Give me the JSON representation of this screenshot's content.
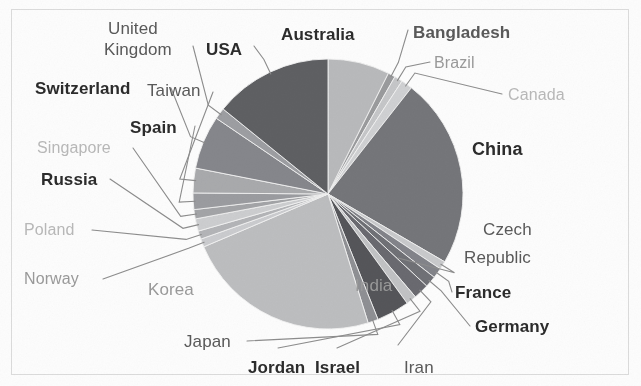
{
  "chart_data": {
    "type": "pie",
    "title": "",
    "subtitle": "",
    "xlabel": "",
    "ylabel": "",
    "legend_position": "callout-labels",
    "grid": false,
    "label_style": "leader-line callouts around pie",
    "categories": [
      "Australia",
      "Bangladesh",
      "Brazil",
      "Canada",
      "China",
      "Czech Republic",
      "France",
      "Germany",
      "Iran",
      "Israel",
      "Jordan",
      "Japan",
      "Korea",
      "Norway",
      "Poland",
      "Russia",
      "Singapore",
      "Spain",
      "Taiwan",
      "Switzerland",
      "USA",
      "United Kingdom",
      "India"
    ],
    "values": [
      6.0,
      0.7,
      0.8,
      1.1,
      18.5,
      0.8,
      1.0,
      1.1,
      1.5,
      1.0,
      3.2,
      1.0,
      19.0,
      0.8,
      0.8,
      1.2,
      0.9,
      1.6,
      2.4,
      5.2,
      11.5,
      1.1,
      16.8
    ],
    "units": "percent of total",
    "slice_order_clockwise_from_top": [
      "Australia",
      "Bangladesh",
      "Brazil",
      "Canada",
      "China",
      "Czech Republic",
      "France",
      "Germany",
      "Iran",
      "Israel",
      "Jordan",
      "Japan",
      "Korea",
      "Norway",
      "Poland",
      "Russia",
      "Singapore",
      "Spain",
      "Taiwan",
      "Switzerland",
      "United Kingdom",
      "USA"
    ]
  },
  "palette": {
    "background": "#fdfdfd",
    "border": "#dcdcdc",
    "label_dark": "#2c2c2c",
    "label_mid": "#5a5a5a",
    "label_light": "#9a9a9a",
    "label_faint": "#b9b9b9",
    "leader_line": "#8d8d8d",
    "slice_darkest": "#58595b",
    "slice_dark": "#6d6e70",
    "slice_mid": "#8a8b8d",
    "slice_light": "#a7a8aa",
    "slice_lighter": "#bcbdbf",
    "slice_lightest": "#d2d3d5"
  },
  "labels": [
    {
      "key": "united_kingdom",
      "text": "United",
      "weight": "500",
      "tone": "label_mid",
      "size": 17,
      "x": 108,
      "y": 20
    },
    {
      "key": "united_kingdom2",
      "text": "Kingdom",
      "weight": "500",
      "tone": "label_mid",
      "size": 17,
      "x": 104,
      "y": 41
    },
    {
      "key": "usa",
      "text": "USA",
      "weight": "700",
      "tone": "label_dark",
      "size": 17,
      "x": 206,
      "y": 41
    },
    {
      "key": "australia",
      "text": "Australia",
      "weight": "700",
      "tone": "label_dark",
      "size": 17,
      "x": 281,
      "y": 26
    },
    {
      "key": "bangladesh",
      "text": "Bangladesh",
      "weight": "700",
      "tone": "label_mid",
      "size": 17,
      "x": 413,
      "y": 24
    },
    {
      "key": "brazil",
      "text": "Brazil",
      "weight": "500",
      "tone": "label_light",
      "size": 16,
      "x": 434,
      "y": 55
    },
    {
      "key": "canada",
      "text": "Canada",
      "weight": "500",
      "tone": "label_faint",
      "size": 16,
      "x": 508,
      "y": 87
    },
    {
      "key": "switzerland",
      "text": "Switzerland",
      "weight": "700",
      "tone": "label_dark",
      "size": 17,
      "x": 35,
      "y": 80
    },
    {
      "key": "taiwan",
      "text": "Taiwan",
      "weight": "500",
      "tone": "label_mid",
      "size": 17,
      "x": 147,
      "y": 82
    },
    {
      "key": "spain",
      "text": "Spain",
      "weight": "700",
      "tone": "label_dark",
      "size": 17,
      "x": 130,
      "y": 119
    },
    {
      "key": "singapore",
      "text": "Singapore",
      "weight": "500",
      "tone": "label_faint",
      "size": 16,
      "x": 37,
      "y": 140
    },
    {
      "key": "russia",
      "text": "Russia",
      "weight": "600",
      "tone": "label_dark",
      "size": 17,
      "x": 41,
      "y": 171
    },
    {
      "key": "poland",
      "text": "Poland",
      "weight": "500",
      "tone": "label_faint",
      "size": 16,
      "x": 24,
      "y": 222
    },
    {
      "key": "norway",
      "text": "Norway",
      "weight": "500",
      "tone": "label_light",
      "size": 16,
      "x": 24,
      "y": 271
    },
    {
      "key": "korea",
      "text": "Korea",
      "weight": "500",
      "tone": "label_light",
      "size": 17,
      "x": 148,
      "y": 281
    },
    {
      "key": "japan",
      "text": "Japan",
      "weight": "500",
      "tone": "label_mid",
      "size": 17,
      "x": 184,
      "y": 333
    },
    {
      "key": "jordan",
      "text": "Jordan",
      "weight": "700",
      "tone": "label_dark",
      "size": 17,
      "x": 248,
      "y": 359
    },
    {
      "key": "israel",
      "text": "Israel",
      "weight": "700",
      "tone": "label_dark",
      "size": 17,
      "x": 315,
      "y": 359
    },
    {
      "key": "iran",
      "text": "Iran",
      "weight": "500",
      "tone": "label_mid",
      "size": 17,
      "x": 404,
      "y": 359
    },
    {
      "key": "germany",
      "text": "Germany",
      "weight": "700",
      "tone": "label_dark",
      "size": 17,
      "x": 475,
      "y": 318
    },
    {
      "key": "france",
      "text": "France",
      "weight": "700",
      "tone": "label_dark",
      "size": 17,
      "x": 455,
      "y": 284
    },
    {
      "key": "czech",
      "text": "Czech",
      "weight": "500",
      "tone": "label_mid",
      "size": 17,
      "x": 483,
      "y": 221
    },
    {
      "key": "czech2",
      "text": "Republic",
      "weight": "500",
      "tone": "label_mid",
      "size": 17,
      "x": 464,
      "y": 249
    },
    {
      "key": "china",
      "text": "China",
      "weight": "700",
      "tone": "label_dark",
      "size": 18,
      "x": 472,
      "y": 140
    },
    {
      "key": "india",
      "text": "India",
      "weight": "500",
      "tone": "label_light",
      "size": 17,
      "x": 355,
      "y": 277
    }
  ]
}
